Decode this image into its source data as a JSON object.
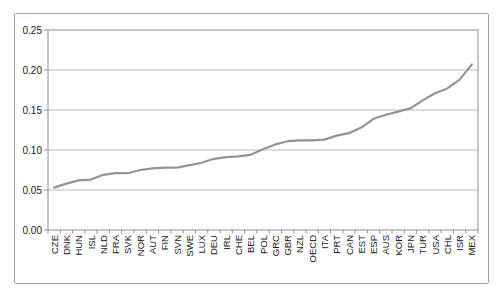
{
  "window": {
    "background": "#ffffff",
    "frame_border_color": "#a3a3a3"
  },
  "chart_data": {
    "type": "line",
    "title": "",
    "xlabel": "",
    "ylabel": "",
    "categories": [
      "CZE",
      "DNK",
      "HUN",
      "ISL",
      "NLD",
      "FRA",
      "SVK",
      "NOR",
      "AUT",
      "FIN",
      "SVN",
      "SWE",
      "LUX",
      "DEU",
      "IRL",
      "CHE",
      "BEL",
      "POL",
      "GRC",
      "GBR",
      "NZL",
      "OECD",
      "ITA",
      "PRT",
      "CAN",
      "EST",
      "ESP",
      "AUS",
      "KOR",
      "JPN",
      "TUR",
      "USA",
      "CHL",
      "ISR",
      "MEX"
    ],
    "values": [
      0.053,
      0.058,
      0.062,
      0.063,
      0.069,
      0.071,
      0.071,
      0.075,
      0.077,
      0.078,
      0.078,
      0.081,
      0.084,
      0.089,
      0.091,
      0.092,
      0.094,
      0.101,
      0.107,
      0.111,
      0.112,
      0.112,
      0.113,
      0.118,
      0.121,
      0.128,
      0.139,
      0.144,
      0.148,
      0.152,
      0.162,
      0.171,
      0.177,
      0.188,
      0.207
    ],
    "ylim": [
      0,
      0.25
    ],
    "ytick_interval": 0.05,
    "ytick_labels": [
      "0.00",
      "0.05",
      "0.10",
      "0.15",
      "0.20",
      "0.25"
    ],
    "grid": true,
    "legend": "none",
    "line_color": "#949494",
    "gridline_color": "#b8b8b8",
    "axis_color": "#8f8f8f",
    "tick_label_color": "#1a1a1a"
  }
}
